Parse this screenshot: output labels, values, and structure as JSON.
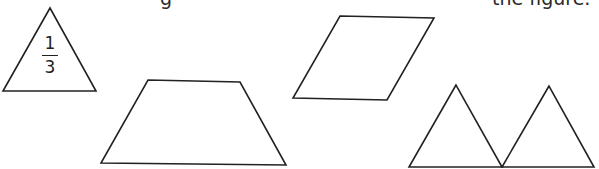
{
  "instruction": {
    "partial_text_left": "g",
    "partial_text_right": "the figure."
  },
  "shapes": {
    "unit_triangle": {
      "name": "triangle",
      "label_numerator": "1",
      "label_denominator": "3",
      "points": "50,8 3,91 96,91"
    },
    "trapezoid": {
      "name": "trapezoid",
      "points": "148,80 240,82 286,165 101,163"
    },
    "parallelogram": {
      "name": "parallelogram",
      "points": "340,16 434,18 387,100 293,98"
    },
    "triangle_left": {
      "name": "triangle",
      "points": "456,85 409,167 502,167"
    },
    "triangle_right": {
      "name": "triangle",
      "points": "549,86 502,167 594,167"
    }
  },
  "colors": {
    "stroke": "#222222",
    "background": "#ffffff"
  }
}
